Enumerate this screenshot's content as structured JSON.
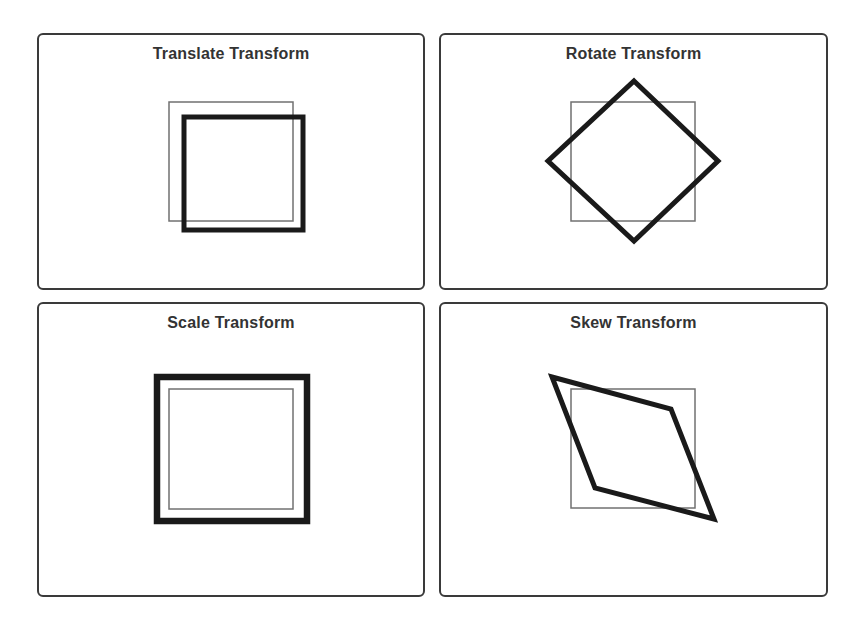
{
  "colors": {
    "background": "#ffffff",
    "panel_border": "#3a3a3a",
    "title_text": "#333333",
    "original_stroke": "#707070",
    "transformed_stroke": "#1a1a1a"
  },
  "panels": [
    {
      "id": "translate",
      "title": "Translate Transform",
      "original_shape": {
        "type": "rect",
        "x": 169,
        "y": 102,
        "width": 124,
        "height": 119
      },
      "transformed_shape": {
        "type": "rect",
        "x": 184,
        "y": 117,
        "width": 119,
        "height": 113
      },
      "transform": "translate(15, 15)"
    },
    {
      "id": "rotate",
      "title": "Rotate Transform",
      "original_shape": {
        "type": "rect",
        "x": 571,
        "y": 102,
        "width": 124,
        "height": 119
      },
      "transformed_shape": {
        "type": "polygon",
        "points": [
          [
            634,
            81
          ],
          [
            718,
            161
          ],
          [
            634,
            241
          ],
          [
            548,
            161
          ]
        ]
      },
      "transform": "rotate(45deg)"
    },
    {
      "id": "scale",
      "title": "Scale Transform",
      "original_shape": {
        "type": "rect",
        "x": 169,
        "y": 389,
        "width": 124,
        "height": 120
      },
      "transformed_shape": {
        "type": "rect",
        "x": 157,
        "y": 377,
        "width": 150,
        "height": 144
      },
      "transform": "scale(1.2)"
    },
    {
      "id": "skew",
      "title": "Skew Transform",
      "original_shape": {
        "type": "rect",
        "x": 571,
        "y": 389,
        "width": 124,
        "height": 119
      },
      "transformed_shape": {
        "type": "polygon",
        "points": [
          [
            552,
            377
          ],
          [
            671,
            409
          ],
          [
            714,
            519
          ],
          [
            595,
            488
          ]
        ]
      },
      "transform": "skew(20deg, 15deg)"
    }
  ]
}
